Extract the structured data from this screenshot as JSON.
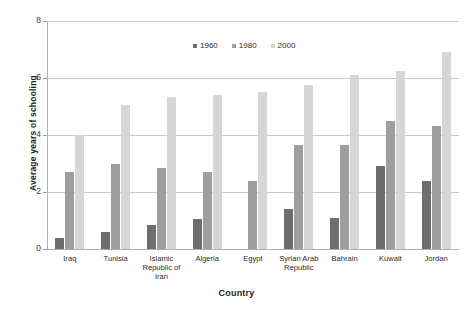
{
  "chart_data": {
    "type": "bar",
    "title": "",
    "xlabel": "Country",
    "ylabel": "Average years of schooling",
    "ylim": [
      0,
      8
    ],
    "yticks": [
      0,
      2,
      4,
      6,
      8
    ],
    "grid": true,
    "legend_position": "top-center",
    "categories": [
      "Iraq",
      "Tunisia",
      "Islamic Republic of Iran",
      "Algeria",
      "Egypt",
      "Syrian Arab Republic",
      "Bahrain",
      "Kuwait",
      "Jordan"
    ],
    "category_lines": [
      [
        "Iraq"
      ],
      [
        "Tunisia"
      ],
      [
        "Islamic",
        "Republic of",
        "Iran"
      ],
      [
        "Algeria"
      ],
      [
        "Egypt"
      ],
      [
        "Syrian Arab",
        "Republic"
      ],
      [
        "Bahrain"
      ],
      [
        "Kuwait"
      ],
      [
        "Jordan"
      ]
    ],
    "series": [
      {
        "name": "1960",
        "color": "#6e6e6e",
        "values": [
          0.4,
          0.6,
          0.85,
          1.05,
          0.0,
          1.4,
          1.1,
          2.9,
          2.4
        ]
      },
      {
        "name": "1980",
        "color": "#9e9e9e",
        "values": [
          2.7,
          3.0,
          2.85,
          2.7,
          2.4,
          3.65,
          3.65,
          4.5,
          4.3
        ]
      },
      {
        "name": "2000",
        "color": "#d6d6d6",
        "values": [
          4.0,
          5.05,
          5.35,
          5.4,
          5.5,
          5.75,
          6.1,
          6.25,
          6.9
        ]
      }
    ]
  }
}
